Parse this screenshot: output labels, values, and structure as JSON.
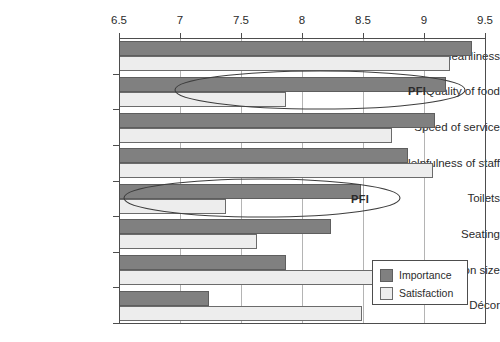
{
  "chart_data": {
    "type": "bar",
    "orientation": "horizontal",
    "title": "",
    "xlabel": "",
    "ylabel": "",
    "xlim": [
      6.5,
      9.5
    ],
    "grid": true,
    "legend_position": "bottom-right",
    "xticks": [
      "6.5",
      "7",
      "7.5",
      "8",
      "8.5",
      "9",
      "9.5"
    ],
    "xtick_values": [
      6.5,
      7,
      7.5,
      8,
      8.5,
      9,
      9.5
    ],
    "categories": [
      "Cleanliness",
      "Quality of food",
      "Speed of service",
      "Helpfulness of staff",
      "Toilets",
      "Seating",
      "Portion size",
      "Décor"
    ],
    "series": [
      {
        "name": "Importance",
        "color": "#808080",
        "values": [
          9.39,
          9.18,
          9.09,
          8.87,
          8.48,
          8.24,
          7.87,
          7.24
        ]
      },
      {
        "name": "Satisfaction",
        "color": "#ededed",
        "values": [
          9.21,
          7.87,
          8.74,
          9.07,
          7.38,
          7.63,
          8.62,
          8.49
        ]
      }
    ],
    "annotations": [
      {
        "label": "PFI",
        "category": "Quality of food"
      },
      {
        "label": "PFI",
        "category": "Toilets"
      }
    ]
  },
  "legend": {
    "entries": [
      {
        "label": "Importance"
      },
      {
        "label": "Satisfaction"
      }
    ]
  }
}
